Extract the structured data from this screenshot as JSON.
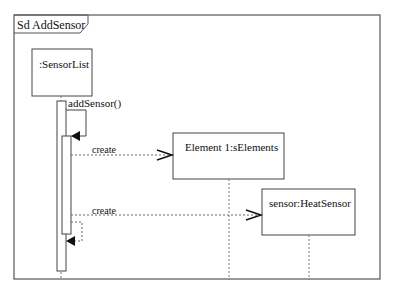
{
  "frame": {
    "title": "Sd AddSensor"
  },
  "lifelines": [
    {
      "label": ":SensorList"
    },
    {
      "label": "Element 1:sElements"
    },
    {
      "label": "sensor:HeatSensor"
    }
  ],
  "messages": [
    {
      "label": "addSensor()",
      "type": "self-sync"
    },
    {
      "label": "create",
      "type": "create"
    },
    {
      "label": "create",
      "type": "create"
    },
    {
      "label": "",
      "type": "self-return"
    }
  ],
  "colors": {
    "line": "#444444",
    "background": "#ffffff"
  }
}
